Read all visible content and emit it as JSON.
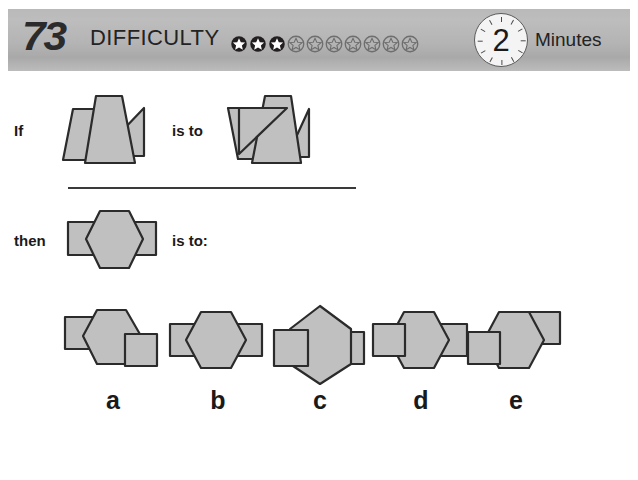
{
  "header": {
    "puzzle_number": "73",
    "difficulty_label": "DIFFICULTY",
    "difficulty_filled": 3,
    "difficulty_total": 10,
    "timer_value": "2",
    "timer_unit": "Minutes",
    "bar_color": "#b5b5b5",
    "text_color": "#232323"
  },
  "prompt": {
    "if_word": "If",
    "is_to_word": "is to",
    "then_word": "then",
    "is_to_colon_word": "is to:"
  },
  "figures": {
    "if_figure": {
      "name": "parallelogram-trapezoid-triangle-overlap",
      "parts": [
        "left-parallelogram",
        "center-trapezoid",
        "right-triangle"
      ]
    },
    "is_to_figure": {
      "name": "parallelogram-trapezoid-triangle-overlap-mirrored",
      "parts": [
        "left-parallelogram",
        "center-trapezoid",
        "right-triangle"
      ]
    },
    "then_figure": {
      "name": "hexagon-with-two-squares",
      "parts": [
        "left-square",
        "center-hexagon",
        "right-square"
      ]
    }
  },
  "options": [
    {
      "id": "a",
      "label": "a",
      "name": "hexagon-left-square-high-right-square-low"
    },
    {
      "id": "b",
      "label": "b",
      "name": "hexagon-both-squares-centered"
    },
    {
      "id": "c",
      "label": "c",
      "name": "rotated-hexagon-both-squares-centered"
    },
    {
      "id": "d",
      "label": "d",
      "name": "hexagon-left-square-front-right-square-behind"
    },
    {
      "id": "e",
      "label": "e",
      "name": "hexagon-left-square-low-right-square-high"
    }
  ],
  "style": {
    "shape_fill": "#c0c0c0",
    "shape_stroke": "#2b2b2b",
    "page_background": "#ffffff"
  }
}
